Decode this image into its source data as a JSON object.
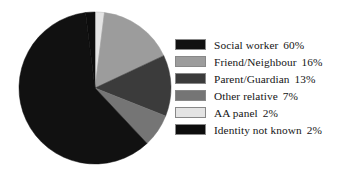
{
  "chart_data": {
    "type": "pie",
    "title": "",
    "subtitle": "",
    "xlabel": "",
    "ylabel": "",
    "grid": false,
    "legend_position": "right",
    "start_angle_deg": 0,
    "direction": "clockwise",
    "categories": [
      "Social worker",
      "Friend/Neighbour",
      "Parent/Guardian",
      "Other relative",
      "AA panel",
      "Identity not known"
    ],
    "values": [
      60,
      16,
      13,
      7,
      2,
      2
    ],
    "value_labels": [
      "60%",
      "16%",
      "13%",
      "7%",
      "2%",
      "2%"
    ],
    "colors": [
      "#111111",
      "#9c9c9c",
      "#3b3b3b",
      "#757575",
      "#e4e4e4",
      "#0d0d0d"
    ],
    "slices": [
      {
        "label": "Social worker",
        "value": 60,
        "value_label": "60%",
        "color": "#111111"
      },
      {
        "label": "Friend/Neighbour",
        "value": 16,
        "value_label": "16%",
        "color": "#9c9c9c"
      },
      {
        "label": "Parent/Guardian",
        "value": 13,
        "value_label": "13%",
        "color": "#3b3b3b"
      },
      {
        "label": "Other relative",
        "value": 7,
        "value_label": "7%",
        "color": "#757575"
      },
      {
        "label": "AA panel",
        "value": 2,
        "value_label": "2%",
        "color": "#e4e4e4"
      },
      {
        "label": "Identity not known",
        "value": 2,
        "value_label": "2%",
        "color": "#0d0d0d"
      }
    ]
  },
  "legend": {
    "items": [
      {
        "label": "Social worker",
        "value_label": "60%",
        "color": "#111111"
      },
      {
        "label": "Friend/Neighbour",
        "value_label": "16%",
        "color": "#9c9c9c"
      },
      {
        "label": "Parent/Guardian",
        "value_label": "13%",
        "color": "#3b3b3b"
      },
      {
        "label": "Other relative",
        "value_label": "7%",
        "color": "#757575"
      },
      {
        "label": "AA panel",
        "value_label": "2%",
        "color": "#e4e4e4"
      },
      {
        "label": "Identity not known",
        "value_label": "2%",
        "color": "#0d0d0d"
      }
    ]
  },
  "figure": {
    "background": "#ffffff",
    "pie": {
      "cx": 78,
      "cy": 78,
      "r": 76
    }
  }
}
